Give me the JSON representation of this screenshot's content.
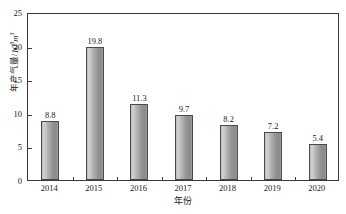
{
  "chart_data": {
    "type": "bar",
    "title": "",
    "subtitle": "",
    "categories": [
      "2014",
      "2015",
      "2016",
      "2017",
      "2018",
      "2019",
      "2020"
    ],
    "values": [
      8.8,
      19.8,
      11.3,
      9.7,
      8.2,
      7.2,
      5.4
    ],
    "value_labels": [
      "8.8",
      "19.8",
      "11.3",
      "9.7",
      "8.2",
      "7.2",
      "5.4"
    ],
    "xlabel": "年份",
    "ylabel": "年产气量 / 10⁸ m³",
    "ylabel_text": "年产气量",
    "ylabel_separator": "/",
    "ylabel_unit_base": "10",
    "ylabel_unit_exp": "8",
    "ylabel_unit_tail": "m",
    "ylabel_unit_tail_exp": "3",
    "ylim": [
      0,
      25
    ],
    "yticks": [
      0,
      5,
      10,
      15,
      20,
      25
    ],
    "ytick_labels": [
      "0",
      "5",
      "10",
      "15",
      "20",
      "25"
    ],
    "grid": false,
    "legend": null,
    "legend_position": "none",
    "series_name": "年产气量",
    "bar_color": "#a8a8a8",
    "bar_edge_color": "#4a4a4a",
    "axis_color": "#3a3a3a",
    "text_color": "#1a1a1a",
    "background": "#ffffff"
  }
}
